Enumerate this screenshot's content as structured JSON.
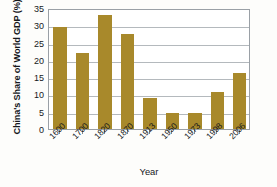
{
  "chart_data": {
    "type": "bar",
    "title": "",
    "xlabel": "Year",
    "ylabel": "China's Share of World GDP (%)",
    "categories": [
      "1600",
      "1700",
      "1820",
      "1870",
      "1913",
      "1950",
      "1973",
      "1998",
      "2006"
    ],
    "values": [
      29.5,
      21.9,
      33.0,
      27.4,
      8.9,
      4.7,
      4.7,
      10.8,
      16.1
    ],
    "ylim": [
      0,
      35
    ],
    "yticks": [
      0,
      5,
      10,
      15,
      20,
      25,
      30,
      35
    ],
    "ytick_labels": [
      "0",
      "5",
      "10",
      "15",
      "20",
      "25",
      "30",
      "35"
    ],
    "grid": true,
    "grid_axis": "y",
    "legend": "none",
    "bar_color": "#A8892B",
    "plot_border_color": "#9AA0A6",
    "gridline_color": "#B4B9BD",
    "background_color": "#FFFFFF",
    "text_color": "#16181C",
    "xtick_label_rotation": -45
  }
}
